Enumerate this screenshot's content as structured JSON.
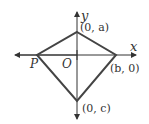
{
  "diagram": {
    "type": "coordinate-geometry",
    "colors": {
      "axis": "#333333",
      "shape": "#444444",
      "text": "#333333",
      "background": "#ffffff"
    },
    "axes": {
      "x_label": "x",
      "y_label": "y",
      "origin_label": "O"
    },
    "vertices": [
      {
        "id": "top",
        "label": "(0, a)",
        "x": 77,
        "y": 32
      },
      {
        "id": "right",
        "label": "(b, 0)",
        "x": 116,
        "y": 55
      },
      {
        "id": "bottom",
        "label": "(0, c)",
        "x": 77,
        "y": 101
      },
      {
        "id": "left",
        "label": "P",
        "x": 37,
        "y": 55
      }
    ]
  }
}
